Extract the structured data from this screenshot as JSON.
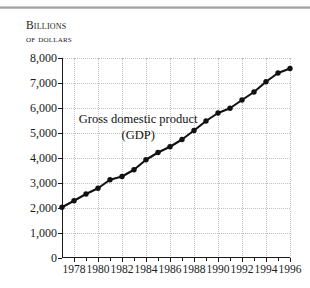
{
  "chart_data": {
    "type": "line",
    "title": "",
    "axis_title_lines": [
      "Billions",
      "of dollars"
    ],
    "ylabel": "Billions of dollars",
    "xlabel": "",
    "annotation_lines": [
      "Gross domestic product",
      "(GDP)"
    ],
    "ylim": [
      0,
      8000
    ],
    "xlim": [
      1977,
      1996
    ],
    "ytick_values": [
      0,
      1000,
      2000,
      3000,
      4000,
      5000,
      6000,
      7000,
      8000
    ],
    "ytick_labels": [
      "0",
      "1,000",
      "2,000",
      "3,000",
      "4,000",
      "5,000",
      "6,000",
      "7,000",
      "8,000"
    ],
    "xtick_values": [
      1978,
      1980,
      1982,
      1984,
      1986,
      1988,
      1990,
      1992,
      1994,
      1996
    ],
    "xtick_labels": [
      "1978",
      "1980",
      "1982",
      "1984",
      "1986",
      "1988",
      "1990",
      "1992",
      "1994",
      "1996"
    ],
    "x_minor_ticks": [
      1977,
      1979,
      1981,
      1983,
      1985,
      1987,
      1989,
      1991,
      1993,
      1995
    ],
    "grid": true,
    "legend": "none",
    "series": [
      {
        "name": "Gross domestic product (GDP)",
        "color": "#111111",
        "marker": "circle",
        "x": [
          1977,
          1978,
          1979,
          1980,
          1981,
          1982,
          1983,
          1984,
          1985,
          1986,
          1987,
          1988,
          1989,
          1990,
          1991,
          1992,
          1993,
          1994,
          1995,
          1996
        ],
        "values": [
          2030,
          2290,
          2560,
          2790,
          3130,
          3260,
          3530,
          3930,
          4220,
          4450,
          4740,
          5100,
          5480,
          5800,
          5990,
          6320,
          6640,
          7050,
          7400,
          7580
        ]
      }
    ]
  },
  "figure": {
    "background": "#ffffff",
    "rule_color": "#9a9a9a",
    "grid_color": "#c2c2c2",
    "axis_color": "#1a1a1a"
  }
}
